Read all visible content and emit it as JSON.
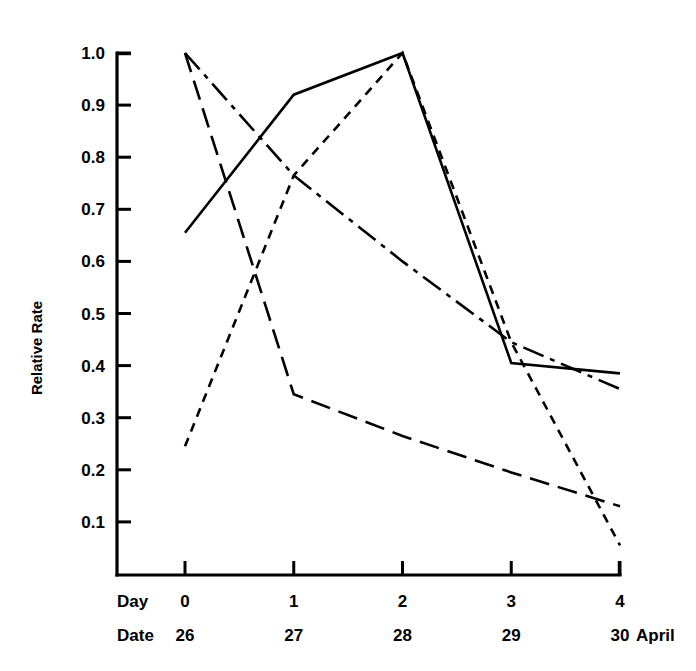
{
  "chart_data": {
    "type": "line",
    "title": "",
    "subtitle": "",
    "xlabel": "Day",
    "ylabel": "Relative Rate",
    "x": [
      0,
      1,
      2,
      3,
      4
    ],
    "xlim": [
      0,
      4
    ],
    "ylim": [
      0,
      1.05
    ],
    "grid": false,
    "legend_position": "none",
    "y_ticks": [
      "1.0",
      "0.9",
      "0.8",
      "0.7",
      "0.6",
      "0.5",
      "0.4",
      "0.3",
      "0.2",
      "0.1"
    ],
    "y_tick_values": [
      1.0,
      0.9,
      0.8,
      0.7,
      0.6,
      0.5,
      0.4,
      0.3,
      0.2,
      0.1
    ],
    "x_axis_rows": [
      {
        "header": "Day",
        "ticks": [
          "0",
          "1",
          "2",
          "3",
          "4"
        ],
        "suffix": ""
      },
      {
        "header": "Date",
        "ticks": [
          "26",
          "27",
          "28",
          "29",
          "30"
        ],
        "suffix": "April"
      }
    ],
    "series": [
      {
        "name": "series-solid",
        "style": "solid",
        "dasharray": "",
        "values": [
          0.655,
          0.92,
          1.0,
          0.405,
          0.385
        ]
      },
      {
        "name": "series-short-dash",
        "style": "short-dash",
        "dasharray": "9 7",
        "values": [
          0.245,
          0.765,
          1.0,
          0.445,
          0.055
        ]
      },
      {
        "name": "series-dash-dot",
        "style": "dash-dot",
        "dasharray": "22 7 5 7",
        "values": [
          1.0,
          0.765,
          0.6,
          0.445,
          0.355
        ]
      },
      {
        "name": "series-long-dash",
        "style": "long-dash",
        "dasharray": "20 9",
        "values": [
          1.0,
          0.345,
          0.265,
          0.195,
          0.13
        ]
      }
    ]
  },
  "geometry": {
    "axis_origin_x": 117,
    "axis_origin_y": 575,
    "axis_top_y": 53,
    "axis_right_x": 620,
    "x_first_tick": 185,
    "x_step": 108.75,
    "y_top_value_y": 53,
    "y_px_per_unit": 521.0
  },
  "colors": {
    "background": "#ffffff",
    "ink": "#000000"
  }
}
